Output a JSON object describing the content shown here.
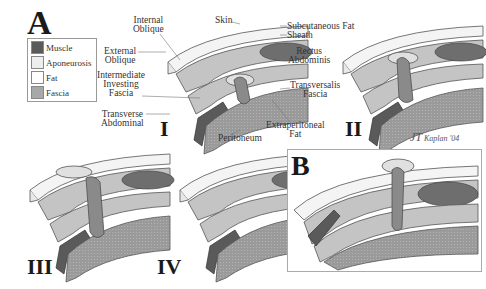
{
  "figure": {
    "panel_a_letter": "A",
    "panel_b_letter": "B",
    "stages": [
      "I",
      "II",
      "III",
      "IV"
    ],
    "signature": "Kaplan '04",
    "signature_initials": "JT"
  },
  "legend": {
    "items": [
      {
        "label": "Muscle",
        "color": "#5a5a5a"
      },
      {
        "label": "Aponeurosis",
        "color": "#eeeeee"
      },
      {
        "label": "Fat",
        "color": "#ffffff"
      },
      {
        "label": "Fascia",
        "color": "#a8a8a8"
      }
    ]
  },
  "labels": {
    "internal_oblique": [
      "Internal",
      "Oblique"
    ],
    "skin": "Skin",
    "subcutaneous_fat": "Subcutaneous Fat",
    "sheath": "Sheath",
    "external_oblique": [
      "External",
      "Oblique"
    ],
    "rectus_abdominis": [
      "Rectus",
      "Abdominis"
    ],
    "intermediate_investing_fascia": [
      "Intermediate",
      "Investing",
      "Fascia"
    ],
    "transversalis_fascia": [
      "Transversalis",
      "Fascia"
    ],
    "transverse_abdominal": [
      "Transverse",
      "Abdominal"
    ],
    "extraperitoneal_fat": [
      "Extraperitoneal",
      "Fat"
    ],
    "peritoneum": "Peritoneum"
  },
  "colors": {
    "muscle": "#5a5a5a",
    "rectus": "#6e6e6e",
    "fascia": "#a8a8a8",
    "aponeurosis": "#eeeeee",
    "layer_light": "#c4c4c4",
    "outline": "#555555"
  }
}
